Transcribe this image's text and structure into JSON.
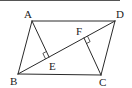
{
  "figure": {
    "type": "parallelogram with diagonal and perpendiculars",
    "stroke_color": "#2a2a2a",
    "points": {
      "A": {
        "label": "A",
        "x": 32,
        "y": 21,
        "label_x": 24,
        "label_y": 18
      },
      "B": {
        "label": "B",
        "x": 18,
        "y": 74,
        "label_x": 10,
        "label_y": 85
      },
      "C": {
        "label": "C",
        "x": 101,
        "y": 75,
        "label_x": 99,
        "label_y": 86
      },
      "D": {
        "label": "D",
        "x": 115,
        "y": 21,
        "label_x": 116,
        "label_y": 18
      },
      "E": {
        "label": "E",
        "x": 49,
        "y": 57,
        "label_x": 49,
        "label_y": 70
      },
      "F": {
        "label": "F",
        "x": 84,
        "y": 38,
        "label_x": 76,
        "label_y": 35
      }
    },
    "segments": [
      "AB",
      "BC",
      "CD",
      "DA",
      "BD",
      "AE",
      "CF"
    ],
    "right_angles": [
      "AEB",
      "CFD"
    ]
  }
}
